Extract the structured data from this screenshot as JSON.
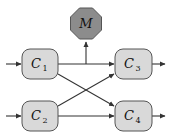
{
  "diagram": {
    "nodes": [
      {
        "id": "C1",
        "label": "C",
        "sub": "1",
        "shape": "rounded-rect",
        "fill": "#d9d9d9"
      },
      {
        "id": "C2",
        "label": "C",
        "sub": "2",
        "shape": "rounded-rect",
        "fill": "#d9d9d9"
      },
      {
        "id": "C3",
        "label": "C",
        "sub": "3",
        "shape": "rounded-rect",
        "fill": "#d9d9d9"
      },
      {
        "id": "C4",
        "label": "C",
        "sub": "4",
        "shape": "rounded-rect",
        "fill": "#d9d9d9"
      },
      {
        "id": "M",
        "label": "M",
        "shape": "octagon",
        "fill": "#8c8c8c"
      }
    ],
    "edges": [
      {
        "from": "input",
        "to": "C1"
      },
      {
        "from": "input",
        "to": "C2"
      },
      {
        "from": "C1",
        "to": "C3"
      },
      {
        "from": "C1",
        "to": "C4"
      },
      {
        "from": "C2",
        "to": "C3"
      },
      {
        "from": "C2",
        "to": "C4"
      },
      {
        "from": "C1-C3 edge",
        "to": "M"
      },
      {
        "from": "C3",
        "to": "output"
      },
      {
        "from": "C4",
        "to": "output"
      }
    ],
    "colors": {
      "box_fill": "#d9d9d9",
      "box_stroke": "#555555",
      "octagon_fill": "#8c8c8c",
      "edge": "#333333"
    }
  }
}
